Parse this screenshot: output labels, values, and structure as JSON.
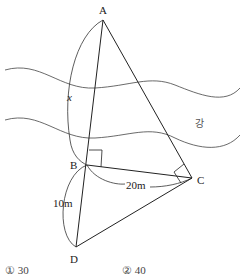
{
  "diagram": {
    "points": {
      "A": {
        "label": "A",
        "x": 103,
        "y": 20
      },
      "B": {
        "label": "B",
        "x": 87,
        "y": 165
      },
      "C": {
        "label": "C",
        "x": 192,
        "y": 178
      },
      "D": {
        "label": "D",
        "x": 76,
        "y": 247
      }
    },
    "labels": {
      "x": "x",
      "bc": "20m",
      "bd": "10m",
      "river": "강"
    },
    "colors": {
      "line": "#222222",
      "river": "#444444"
    }
  },
  "options": [
    {
      "label": "① 30"
    },
    {
      "label": "② 40"
    }
  ]
}
